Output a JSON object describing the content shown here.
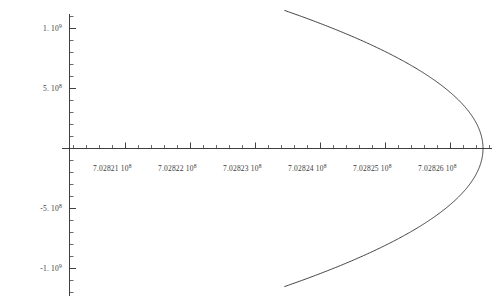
{
  "chart_data": {
    "type": "line",
    "title": "",
    "xlabel": "",
    "ylabel": "",
    "xlim": [
      702820500,
      702826500
    ],
    "ylim": [
      -1150000000,
      1150000000
    ],
    "grid": false,
    "legend": null,
    "curve": {
      "name": "parabola-branch",
      "vertex_x": 702826500,
      "vertex_y": 0,
      "axis_of_symmetry_y": 0,
      "opens": "left",
      "x_at_y_max": 702823450,
      "y_max": 1150000000,
      "y_min": -1150000000
    },
    "x_axis": {
      "tick_values": [
        702821000,
        702822000,
        702823000,
        702824000,
        702825000,
        702826000
      ],
      "tick_labels": [
        "7.02821 10",
        "7.02822 10",
        "7.02823 10",
        "7.02824 10",
        "7.02825 10",
        "7.02826 10"
      ],
      "tick_exponents": [
        "8",
        "8",
        "8",
        "8",
        "8",
        "8"
      ],
      "minor_ticks_per_interval": 4
    },
    "y_axis": {
      "tick_values": [
        1000000000,
        500000000,
        -500000000,
        -1000000000
      ],
      "tick_labels": [
        "1. 10",
        "5. 10",
        "-5. 10",
        "-1. 10"
      ],
      "tick_exponents": [
        "9",
        "8",
        "8",
        "9"
      ],
      "minor_ticks_per_interval": 4
    },
    "style": {
      "curve_color": "#2b2b2b",
      "axis_color": "#2b2b2b",
      "label_color": "#3a3a3a",
      "background": "#ffffff"
    }
  },
  "axis_labels": {
    "y": [
      {
        "mantissa": "1. 10",
        "exp": "9"
      },
      {
        "mantissa": "5. 10",
        "exp": "8"
      },
      {
        "mantissa": "-5. 10",
        "exp": "8"
      },
      {
        "mantissa": "-1. 10",
        "exp": "9"
      }
    ],
    "x": [
      {
        "mantissa": "7.02821 10",
        "exp": "8"
      },
      {
        "mantissa": "7.02822 10",
        "exp": "8"
      },
      {
        "mantissa": "7.02823 10",
        "exp": "8"
      },
      {
        "mantissa": "7.02824 10",
        "exp": "8"
      },
      {
        "mantissa": "7.02825 10",
        "exp": "8"
      },
      {
        "mantissa": "7.02826 10",
        "exp": "8"
      }
    ]
  }
}
